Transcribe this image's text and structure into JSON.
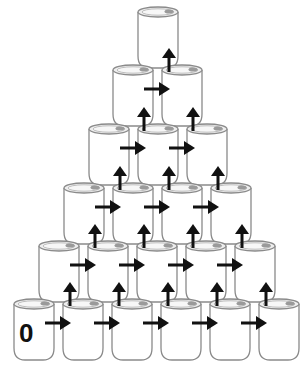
{
  "diagram": {
    "rows": [
      1,
      2,
      3,
      4,
      5,
      6
    ],
    "start_label": "0",
    "colors": {
      "can_outline": "#8a8a8a",
      "can_fill": "#ffffff",
      "lid_fill": "#eeeeee",
      "tab_fill": "#9a9a9a",
      "arrow": "#111111",
      "label": "#111111"
    },
    "arrows": {
      "right_direction": "right-arrow",
      "up_direction": "up-arrow"
    }
  }
}
